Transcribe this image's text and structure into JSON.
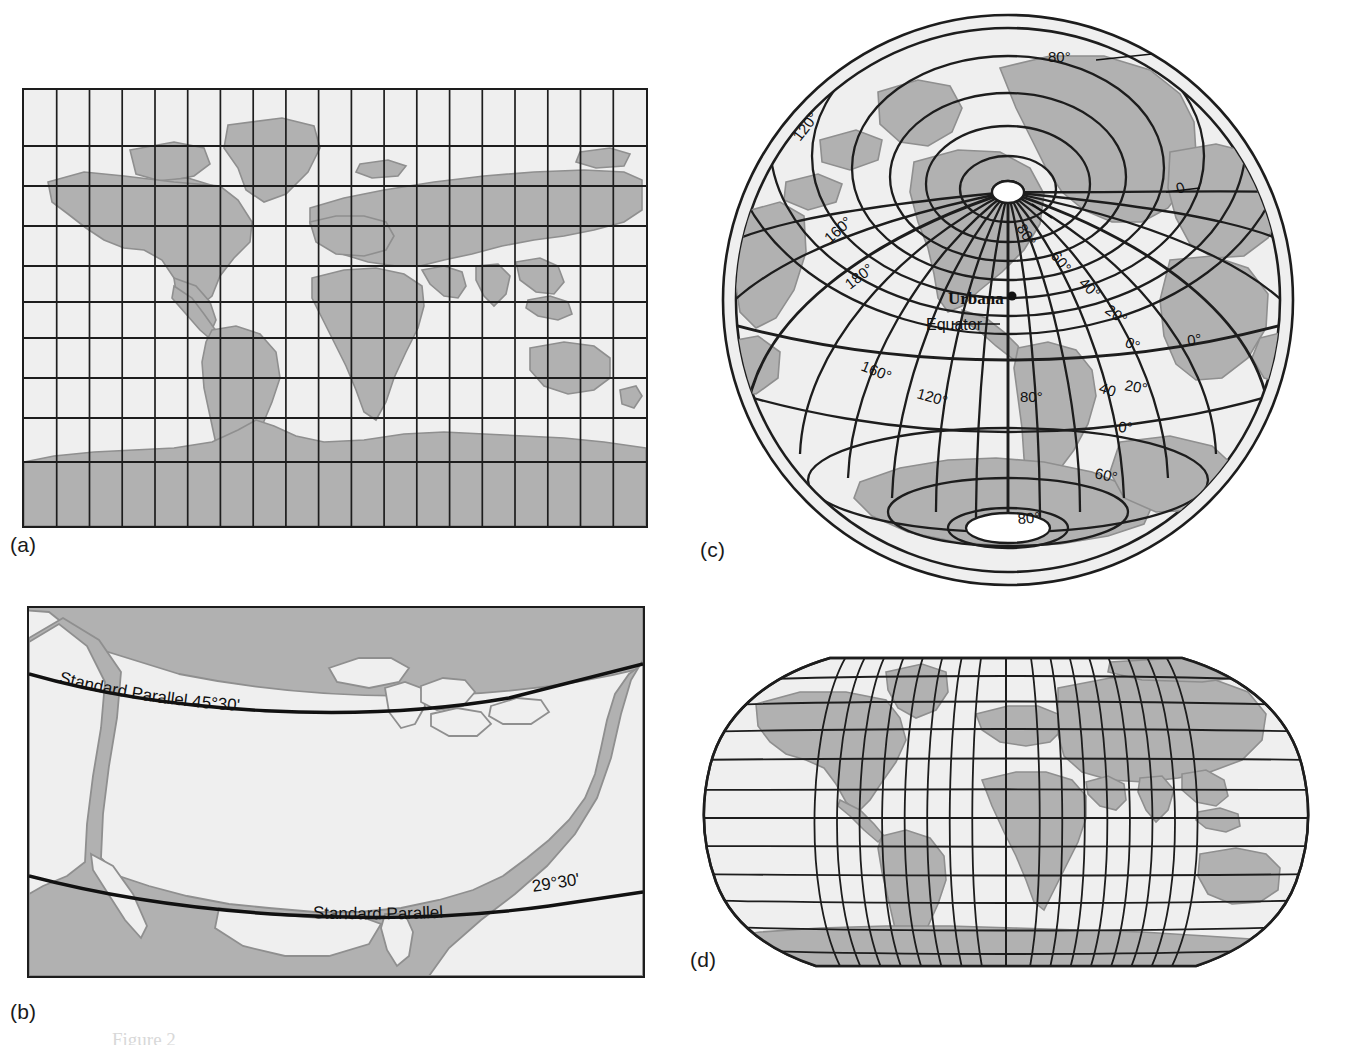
{
  "figure": {
    "background_color": "#ffffff",
    "land_color": "#b1b1b1",
    "ocean_color": "#efefef",
    "line_color": "#1d1d1d",
    "coast_color": "#8f8f8f",
    "partial_caption": "Figure 2"
  },
  "panels": [
    {
      "id": "a",
      "label": "(a)",
      "projection_type": "cylindrical",
      "description": "Mercator-style cylindrical world map with rectangular graticule",
      "graticule": {
        "meridian_count": 19,
        "parallel_count": 10,
        "grid_interval_deg": 20
      },
      "labels": []
    },
    {
      "id": "b",
      "label": "(b)",
      "projection_type": "conic",
      "description": "Albers conic projection of the conterminous United States with two standard parallels",
      "labels": [
        {
          "name": "standard-parallel-north",
          "text": "Standard Parallel 45°30'"
        },
        {
          "name": "standard-parallel-south-text",
          "text": "Standard   Parallel"
        },
        {
          "name": "standard-parallel-south-value",
          "text": "29°30'"
        }
      ]
    },
    {
      "id": "c",
      "label": "(c)",
      "projection_type": "azimuthal-oblique",
      "description": "Oblique azimuthal (planar) projection centered on Urbana",
      "center_place": "Urbana",
      "labels": [
        {
          "name": "place-urbana",
          "text": "Urbana"
        },
        {
          "name": "equator-label",
          "text": "Equator"
        },
        {
          "name": "meridian-120-nw",
          "text": "120°"
        },
        {
          "name": "meridian-160-nw",
          "text": "160°"
        },
        {
          "name": "meridian-180",
          "text": "180°"
        },
        {
          "name": "meridian-160-sw",
          "text": "160°"
        },
        {
          "name": "meridian-120-sw",
          "text": "120°"
        },
        {
          "name": "meridian-80-s",
          "text": "80°"
        },
        {
          "name": "parallel-80-n",
          "text": "80°"
        },
        {
          "name": "parallel-80-center",
          "text": "80°"
        },
        {
          "name": "parallel-60-ne",
          "text": "60°"
        },
        {
          "name": "parallel-40-ne",
          "text": "40°"
        },
        {
          "name": "parallel-20-ne",
          "text": "20°"
        },
        {
          "name": "parallel-0-e",
          "text": "0°"
        },
        {
          "name": "meridian-0-ne",
          "text": "0"
        },
        {
          "name": "parallel-0-far-e",
          "text": "0°"
        },
        {
          "name": "parallel-40-se",
          "text": "40"
        },
        {
          "name": "parallel-20-se",
          "text": "20°"
        },
        {
          "name": "parallel-0-se",
          "text": "0°"
        },
        {
          "name": "parallel-60-s",
          "text": "60°"
        },
        {
          "name": "parallel-80-s",
          "text": "80°"
        }
      ]
    },
    {
      "id": "d",
      "label": "(d)",
      "projection_type": "pseudocylindrical",
      "description": "Robinson-style pseudocylindrical world map with curved meridians",
      "graticule": {
        "meridian_count": 19,
        "parallel_count": 13,
        "grid_interval_deg": 20
      },
      "labels": []
    }
  ]
}
